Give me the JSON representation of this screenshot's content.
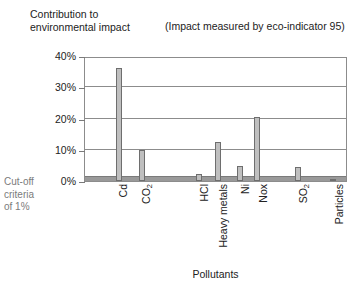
{
  "chart_data": {
    "type": "bar",
    "title": "Contribution to\nenvironmental impact",
    "subtitle": "(Impact measured by eco-indicator 95)",
    "xlabel": "Pollutants",
    "ylabel": "Contribution to environmental impact",
    "categories": [
      "Cd",
      "CO2",
      "HCl",
      "Heavy metals",
      "Ni",
      "Nox",
      "SO2",
      "Particles"
    ],
    "category_labels_html": [
      "Cd",
      "CO<sub>2</sub>",
      "HCl",
      "Heavy metals",
      "Ni",
      "Nox",
      "SO<sub>2</sub>",
      "Particles"
    ],
    "values": [
      36.3,
      9.8,
      2.4,
      12.6,
      4.9,
      20.4,
      4.4,
      0.8
    ],
    "x_positions_pct": [
      13.0,
      21.8,
      43.8,
      51.0,
      59.5,
      66.0,
      81.5,
      95.2
    ],
    "ylim": [
      0,
      40
    ],
    "yticks": [
      0,
      10,
      20,
      30,
      40
    ],
    "ytick_labels": [
      "0%",
      "10%",
      "20%",
      "30%",
      "40%"
    ],
    "grid": true,
    "legend": "none",
    "annotation": "Cut-off\ncriteria\nof 1%",
    "cutoff_value": 1.5,
    "bar_fill": "#bfbfbf",
    "bar_edge": "#6e6e6e",
    "cutoff_color": "#999999",
    "grid_color": "#8c8c8c"
  }
}
